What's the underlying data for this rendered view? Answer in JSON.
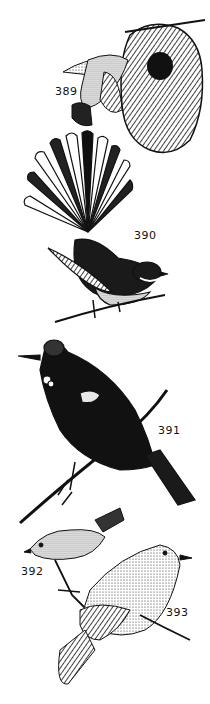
{
  "plate": {
    "background": "#ffffff",
    "ink": "#111111",
    "figures": [
      {
        "id": "389",
        "label": "389",
        "subject": "small bird hovering at a woven hanging nest"
      },
      {
        "id": "390",
        "label": "390",
        "subject": "fantail bird with spread tail on a twig"
      },
      {
        "id": "391",
        "label": "391",
        "subject": "dark bird with white throat tufts perched on a branch"
      },
      {
        "id": "392",
        "label": "392",
        "subject": "small pale bird perched on a twig"
      },
      {
        "id": "393",
        "label": "393",
        "subject": "larger pale bird perched on a branch"
      }
    ]
  }
}
